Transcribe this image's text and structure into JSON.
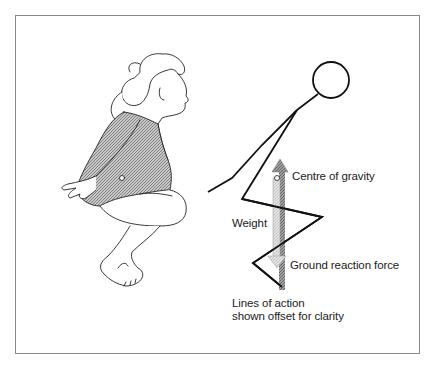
{
  "figure": {
    "labels": {
      "centre_of_gravity": "Centre of gravity",
      "weight": "Weight",
      "ground_reaction_force": "Ground reaction force",
      "caption_line1": "Lines of action",
      "caption_line2": "shown offset for clarity"
    },
    "colors": {
      "frame": "#8a8a8a",
      "stroke": "#111111",
      "weight_arrow": "#d6d6d6",
      "grf_arrow": "#8c8c8c",
      "leotard": "#a8a8a8"
    },
    "illustrations": {
      "left": "woman-crouching-landing",
      "right": "stick-figure-free-body"
    }
  }
}
